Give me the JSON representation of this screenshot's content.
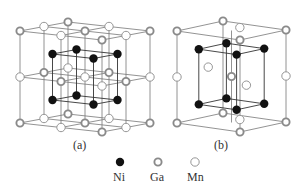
{
  "figure": {
    "panels": [
      {
        "id": "a",
        "label": "(a)",
        "structure": "L21 Heusler cubic unit cell (8 sub-cells)"
      },
      {
        "id": "b",
        "label": "(b)",
        "structure": "tetragonal cell"
      }
    ],
    "legend": [
      {
        "element": "Ni",
        "symbol": "filled-black-circle",
        "color": "#111111"
      },
      {
        "element": "Ga",
        "symbol": "gray-ring-circle",
        "color": "#888888"
      },
      {
        "element": "Mn",
        "symbol": "open-white-circle",
        "color": "#ffffff"
      }
    ]
  },
  "colors": {
    "line": "#777777",
    "ni_fill": "#111111",
    "ga_stroke": "#8a8a8a",
    "mn_stroke": "#8a8a8a",
    "background": "#ffffff"
  }
}
